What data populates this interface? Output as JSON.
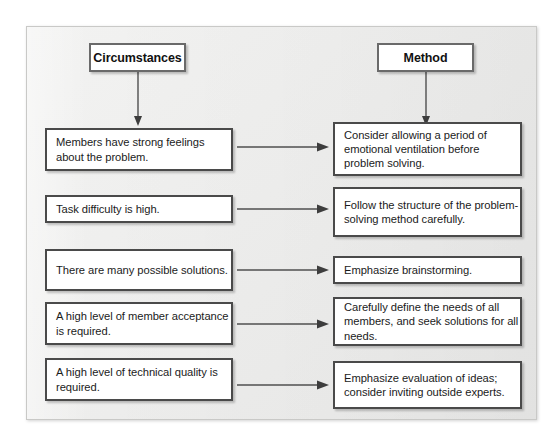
{
  "diagram": {
    "type": "two-column-flow-mapping",
    "columns": [
      {
        "id": "circumstances",
        "header": "Circumstances"
      },
      {
        "id": "method",
        "header": "Method"
      }
    ],
    "rows": [
      {
        "circumstance": "Members have strong feelings about the problem.",
        "method": "Consider allowing a period of emotional ventilation before problem solving."
      },
      {
        "circumstance": "Task difficulty is high.",
        "method": "Follow the structure of the problem-solving method carefully."
      },
      {
        "circumstance": "There are many possible solutions.",
        "method": "Emphasize brainstorming."
      },
      {
        "circumstance": "A high level of member acceptance is required.",
        "method": "Carefully define the needs of all members, and seek solutions for all needs."
      },
      {
        "circumstance": "A high level of technical quality is required.",
        "method": "Emphasize evaluation of ideas; consider inviting outside experts."
      }
    ],
    "colors": {
      "page_background": "#ffffff",
      "frame_background": "#efefee",
      "box_fill": "#ffffff",
      "header_border": "#6a6a6a",
      "content_border": "#4a4a4a",
      "connector": "#4f4f4f",
      "text": "#1b1b1b"
    }
  }
}
